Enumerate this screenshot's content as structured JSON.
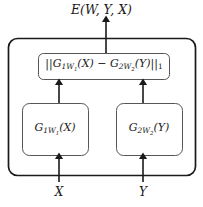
{
  "figure": {
    "type": "architecture-diagram",
    "background_color": "#ffffff",
    "stroke_color": "#1a1a1a",
    "box_fill": "#ffffff"
  },
  "output": {
    "energy_label": "E(W, Y, X)"
  },
  "distance_block": {
    "label_plain": "||G1W1(X) - G2W2(Y)||1",
    "norm_open": "||",
    "term_left_base": "G",
    "term_left_sub": "1",
    "term_left_subsub": "W",
    "term_left_subsubsub": "1",
    "term_left_arg": "(X)",
    "operator": "−",
    "term_right_base": "G",
    "term_right_sub": "2",
    "term_right_subsub": "W",
    "term_right_subsubsub": "2",
    "term_right_arg": "(Y)",
    "norm_close": "||",
    "norm_order": "1"
  },
  "branches": [
    {
      "id": "left",
      "label_plain": "G1W1(X)",
      "base": "G",
      "sub": "1",
      "subsub": "W",
      "subsubsub": "1",
      "arg": "(X)",
      "input_label": "X"
    },
    {
      "id": "right",
      "label_plain": "G2W2(Y)",
      "base": "G",
      "sub": "2",
      "subsub": "W",
      "subsubsub": "2",
      "arg": "(Y)",
      "input_label": "Y"
    }
  ],
  "inputs": {
    "left_label": "X",
    "right_label": "Y"
  },
  "arrows": [
    {
      "name": "energy-output-arrow",
      "from": "distance-block",
      "to": "energy-label"
    },
    {
      "name": "left-branch-to-distance-arrow",
      "from": "branch-left",
      "to": "distance-block"
    },
    {
      "name": "right-branch-to-distance-arrow",
      "from": "branch-right",
      "to": "distance-block"
    },
    {
      "name": "input-x-arrow",
      "from": "input-x",
      "to": "branch-left"
    },
    {
      "name": "input-y-arrow",
      "from": "input-y",
      "to": "branch-right"
    }
  ]
}
